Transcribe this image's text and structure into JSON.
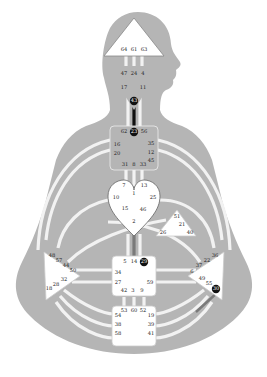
{
  "colors": {
    "background": "#ffffff",
    "body": "#b5b5b5",
    "channel": "#f2f2f2",
    "center_fill": "#ffffff",
    "center_stroke": "#888888",
    "defined": "#111111",
    "partial": "#7a7a7a"
  },
  "centers": {
    "head": {
      "gates": [
        "64",
        "61",
        "63"
      ]
    },
    "ajna": {
      "gates": [
        "47",
        "24",
        "4",
        "17",
        "11",
        "43"
      ]
    },
    "throat": {
      "gates": [
        "62",
        "23",
        "56",
        "16",
        "35",
        "20",
        "12",
        "45",
        "31",
        "8",
        "33"
      ]
    },
    "g": {
      "gates": [
        "7",
        "1",
        "13",
        "10",
        "25",
        "15",
        "46",
        "2"
      ]
    },
    "ego": {
      "gates": [
        "51",
        "21",
        "26",
        "40"
      ]
    },
    "spleen": {
      "gates": [
        "48",
        "57",
        "44",
        "50",
        "32",
        "28",
        "18"
      ]
    },
    "solar_plexus": {
      "gates": [
        "36",
        "22",
        "37",
        "6",
        "49",
        "55",
        "30"
      ]
    },
    "sacral": {
      "gates": [
        "5",
        "14",
        "29",
        "34",
        "27",
        "59",
        "42",
        "3",
        "9"
      ]
    },
    "root": {
      "gates": [
        "53",
        "60",
        "52",
        "54",
        "19",
        "38",
        "39",
        "58",
        "41"
      ]
    }
  },
  "active_gates": [
    "43",
    "23",
    "29",
    "30"
  ],
  "defined_channels": [
    [
      "43",
      "23"
    ]
  ],
  "partial_channels": [
    [
      "2",
      "14"
    ]
  ]
}
